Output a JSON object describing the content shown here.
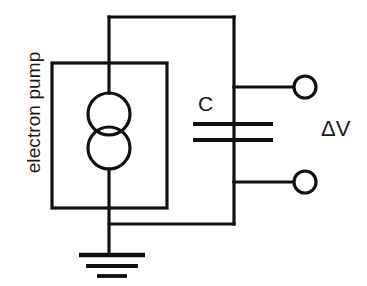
{
  "figure": {
    "background_color": "#ffffff",
    "line_color": "#111111"
  },
  "labels": {
    "electron_pump": "electron pump",
    "capacitor": "C",
    "voltage": "ΔV"
  },
  "components": [
    {
      "name": "electron-pump",
      "type": "current-source",
      "label": "electron pump",
      "symbol": "two-overlapping-circles"
    },
    {
      "name": "capacitor",
      "type": "capacitor",
      "label": "C",
      "symbol": "two-parallel-plates"
    },
    {
      "name": "ground",
      "type": "ground",
      "symbol": "three-decreasing-bars"
    },
    {
      "name": "output-terminal-top",
      "type": "terminal",
      "symbol": "open-circle"
    },
    {
      "name": "output-terminal-bottom",
      "type": "terminal",
      "symbol": "open-circle"
    }
  ],
  "measurement": {
    "quantity": "ΔV",
    "across": "output terminals"
  }
}
